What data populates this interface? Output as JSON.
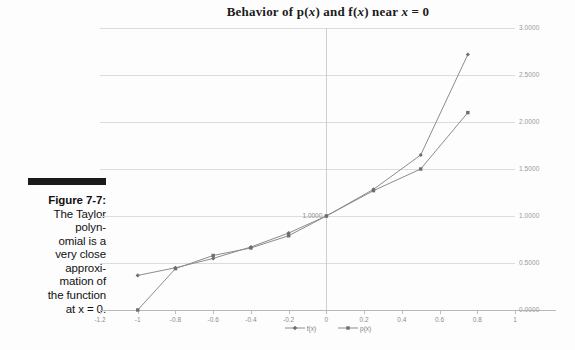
{
  "caption": {
    "rule": "",
    "title": "Figure 7-7:",
    "lines": [
      "The Taylor",
      "polyn-",
      "omial is a",
      "very close",
      "approxi-",
      "mation of",
      "the function",
      "at x = 0."
    ],
    "full_text": "Figure 7-7: The Taylor polynomial is a very close approximation of the function at x = 0."
  },
  "chart_data": {
    "type": "line",
    "title": "Behavior of p(x) and f(x) near x = 0",
    "title_parts": {
      "pre": "Behavior of p(",
      "v1": "x",
      "mid": ") and f(",
      "v2": "x",
      "mid2": ") near ",
      "v3": "x",
      "post": " = 0"
    },
    "xlabel": "",
    "ylabel": "",
    "xlim": [
      -1.2,
      1.0
    ],
    "ylim": [
      0.0,
      3.0
    ],
    "xticks": [
      -1.2,
      -1,
      -0.8,
      -0.6,
      -0.4,
      -0.2,
      0,
      0.2,
      0.4,
      0.6,
      0.8,
      1
    ],
    "xticklabels": [
      "-1.2",
      "-1",
      "-0.8",
      "-0.6",
      "-0.4",
      "-0.2",
      "0",
      "0.2",
      "0.4",
      "0.6",
      "0.8",
      "1"
    ],
    "yticks": [
      0.0,
      0.5,
      1.0,
      1.5,
      2.0,
      2.5,
      3.0
    ],
    "yticklabels": [
      "0.0000",
      "0.5000",
      "1.0000",
      "1.5000",
      "2.0000",
      "2.5000",
      "3.0000"
    ],
    "grid": true,
    "grid_axis": "y",
    "legend_position": "bottom-center",
    "line_color": "#8c8c8c",
    "marker_color": "#6e6e6e",
    "x": [
      -1,
      -0.8,
      -0.6,
      -0.4,
      -0.2,
      0,
      0.25,
      0.5,
      0.75
    ],
    "series": [
      {
        "name": "f(x)",
        "legend": "f(x)",
        "values": [
          0.3679,
          0.4493,
          0.5488,
          0.6703,
          0.8187,
          1.0,
          1.284,
          1.6487,
          2.7183
        ],
        "x": [
          -1,
          -0.8,
          -0.6,
          -0.4,
          -0.2,
          0,
          0.25,
          0.5,
          0.75
        ],
        "marker": "diamond"
      },
      {
        "name": "p(x)",
        "legend": "p(x)",
        "values": [
          0.0,
          0.44,
          0.58,
          0.66,
          0.79,
          1.0,
          1.27,
          1.5,
          2.1
        ],
        "x": [
          -1,
          -0.8,
          -0.6,
          -0.4,
          -0.2,
          0,
          0.25,
          0.5,
          0.75
        ],
        "marker": "square"
      }
    ]
  },
  "legend": {
    "entries": [
      {
        "label": "f(x)",
        "marker": "diamond"
      },
      {
        "label": "p(x)",
        "marker": "square"
      }
    ]
  }
}
